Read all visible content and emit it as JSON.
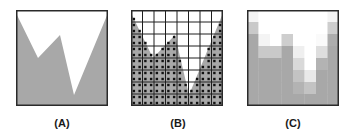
{
  "figure": {
    "colors": {
      "fill_gray": "#a8a8a8",
      "background": "#ffffff",
      "border": "#2a2a2a",
      "grid_line": "#1e1e1e",
      "sample_dot": "#111111"
    },
    "polygon_white_region": [
      [
        0,
        3
      ],
      [
        22,
        48
      ],
      [
        44,
        25
      ],
      [
        58,
        85
      ],
      [
        92,
        3
      ],
      [
        92,
        0
      ],
      [
        0,
        0
      ]
    ],
    "box": {
      "width": 92,
      "height": 96
    },
    "grid": {
      "rows": 8,
      "cols": 8,
      "subsamples": 2
    },
    "panels": [
      {
        "id": "A",
        "label": "(A)",
        "x": 16,
        "y": 10,
        "kind": "continuous"
      },
      {
        "id": "B",
        "label": "(B)",
        "x": 131,
        "y": 10,
        "kind": "sampled"
      },
      {
        "id": "C",
        "label": "(C)",
        "x": 247,
        "y": 10,
        "kind": "antialiased"
      }
    ]
  }
}
